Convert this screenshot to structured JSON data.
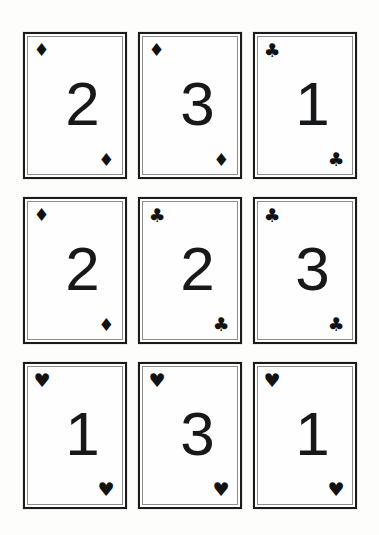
{
  "scene": {
    "title": "Playing card grid",
    "background_color": "#fdfdfc",
    "card_color": "#ffffff",
    "ink_color": "#16181a",
    "border_color": "#1b1b1b",
    "inner_border_color": "#8d8d8d",
    "grid": {
      "rows": 3,
      "columns": 3,
      "total_cards": 9
    }
  },
  "glyphs": {
    "diamond": "♦",
    "club": "♣",
    "heart": "♥"
  },
  "cards": [
    {
      "id": "card-r1c1",
      "row": 1,
      "column": 1,
      "rank": "2",
      "suit": "diamond",
      "suit_glyph": "♦",
      "suit_name": "diamonds",
      "label": "2 of diamonds"
    },
    {
      "id": "card-r1c2",
      "row": 1,
      "column": 2,
      "rank": "3",
      "suit": "diamond",
      "suit_glyph": "♦",
      "suit_name": "diamonds",
      "label": "3 of diamonds"
    },
    {
      "id": "card-r1c3",
      "row": 1,
      "column": 3,
      "rank": "1",
      "suit": "club",
      "suit_glyph": "♣",
      "suit_name": "clubs",
      "label": "1 of clubs"
    },
    {
      "id": "card-r2c1",
      "row": 2,
      "column": 1,
      "rank": "2",
      "suit": "diamond",
      "suit_glyph": "♦",
      "suit_name": "diamonds",
      "label": "2 of diamonds"
    },
    {
      "id": "card-r2c2",
      "row": 2,
      "column": 2,
      "rank": "2",
      "suit": "club",
      "suit_glyph": "♣",
      "suit_name": "clubs",
      "label": "2 of clubs"
    },
    {
      "id": "card-r2c3",
      "row": 2,
      "column": 3,
      "rank": "3",
      "suit": "club",
      "suit_glyph": "♣",
      "suit_name": "clubs",
      "label": "3 of clubs"
    },
    {
      "id": "card-r3c1",
      "row": 3,
      "column": 1,
      "rank": "1",
      "suit": "heart",
      "suit_glyph": "♥",
      "suit_name": "hearts",
      "label": "1 of hearts"
    },
    {
      "id": "card-r3c2",
      "row": 3,
      "column": 2,
      "rank": "3",
      "suit": "heart",
      "suit_glyph": "♥",
      "suit_name": "hearts",
      "label": "3 of hearts"
    },
    {
      "id": "card-r3c3",
      "row": 3,
      "column": 3,
      "rank": "1",
      "suit": "heart",
      "suit_glyph": "♥",
      "suit_name": "hearts",
      "label": "1 of hearts"
    }
  ]
}
